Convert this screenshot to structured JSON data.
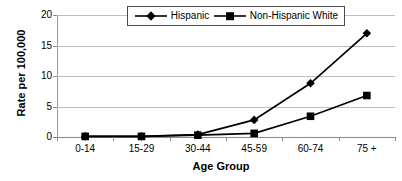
{
  "chart_data": {
    "type": "line",
    "title": "",
    "xlabel": "Age Group",
    "ylabel": "Rate per 100,000",
    "categories": [
      "0-14",
      "15-29",
      "30-44",
      "45-59",
      "60-74",
      "75 +"
    ],
    "yticks": [
      0,
      5,
      10,
      15,
      20
    ],
    "ylim": [
      0,
      20
    ],
    "grid": true,
    "legend_position": "top-center",
    "series": [
      {
        "name": "Hispanic",
        "marker": "diamond",
        "color": "#000000",
        "values": [
          0.1,
          0.1,
          0.4,
          2.8,
          8.8,
          17.0
        ]
      },
      {
        "name": "Non-Hispanic White",
        "marker": "square",
        "color": "#000000",
        "values": [
          0.1,
          0.1,
          0.3,
          0.6,
          3.4,
          6.8
        ]
      }
    ]
  },
  "legend": {
    "items": [
      {
        "label": "Hispanic",
        "marker": "diamond-marker-icon"
      },
      {
        "label": "Non-Hispanic White",
        "marker": "square-marker-icon"
      }
    ]
  },
  "axes": {
    "y_title": "Rate per 100,000",
    "x_title": "Age Group",
    "y_tick_labels": [
      "0",
      "5",
      "10",
      "15",
      "20"
    ],
    "x_tick_labels": [
      "0-14",
      "15-29",
      "30-44",
      "45-59",
      "60-74",
      "75 +"
    ]
  },
  "colors": {
    "series": "#000000",
    "gridline": "#bdbdbd",
    "axis": "#8a8a8a",
    "background": "#ffffff",
    "legend_border": "#4a4a4a"
  }
}
